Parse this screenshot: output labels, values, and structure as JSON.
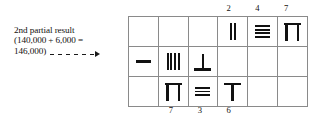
{
  "annotation": {
    "line1": "2nd partial result",
    "line2": "(140,000 + 6,000 =",
    "line3": "146,000)",
    "arrow": "dashed-arrow-right"
  },
  "grid": {
    "columns": 6,
    "rows": 3,
    "top_labels": [
      {
        "col": 4,
        "text": "2"
      },
      {
        "col": 5,
        "text": "4"
      },
      {
        "col": 6,
        "text": "7"
      }
    ],
    "bottom_labels": [
      {
        "col": 2,
        "text": "7"
      },
      {
        "col": 3,
        "text": "3"
      },
      {
        "col": 4,
        "text": "6"
      }
    ],
    "cells": [
      [
        {
          "glyph": "empty",
          "value": ""
        },
        {
          "glyph": "empty",
          "value": ""
        },
        {
          "glyph": "empty",
          "value": ""
        },
        {
          "glyph": "vertical-strokes",
          "count": 2,
          "value": "2"
        },
        {
          "glyph": "horizontal-bars",
          "count": 4,
          "value": "4"
        },
        {
          "glyph": "pi-symbol",
          "value": "7"
        }
      ],
      [
        {
          "glyph": "single-dash",
          "value": "1"
        },
        {
          "glyph": "vertical-strokes",
          "count": 4,
          "value": "4"
        },
        {
          "glyph": "inverted-tee",
          "value": "5"
        },
        {
          "glyph": "empty",
          "value": ""
        },
        {
          "glyph": "empty",
          "value": ""
        },
        {
          "glyph": "empty",
          "value": ""
        }
      ],
      [
        {
          "glyph": "empty",
          "value": ""
        },
        {
          "glyph": "pi-symbol",
          "value": "7"
        },
        {
          "glyph": "horizontal-bars",
          "count": 3,
          "value": "3"
        },
        {
          "glyph": "tee-symbol",
          "value": "6"
        },
        {
          "glyph": "empty",
          "value": ""
        },
        {
          "glyph": "empty",
          "value": ""
        }
      ]
    ]
  },
  "colors": {
    "ink": "#111111",
    "grid_line": "#8a8a8a",
    "background": "#ffffff"
  }
}
